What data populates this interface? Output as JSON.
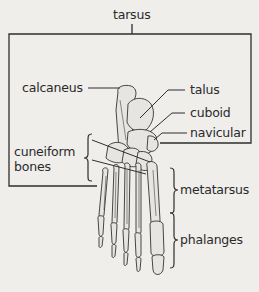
{
  "diagram": {
    "title": "tarsus",
    "labels": {
      "calcaneus": "calcaneus",
      "talus": "talus",
      "cuboid": "cuboid",
      "navicular": "navicular",
      "cuneiform": "cuneiform",
      "cuneiform_line2": "bones",
      "metatarsus": "metatarsus",
      "phalanges": "phalanges"
    },
    "colors": {
      "background": "#efeeeb",
      "line": "#2e2e2e",
      "bone_fill": "#e6e4e0",
      "text": "#2a2a2a"
    }
  }
}
